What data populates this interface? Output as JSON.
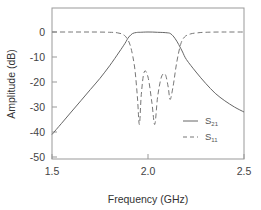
{
  "chart_data": {
    "type": "line",
    "title": "",
    "xlabel": "Frequency (GHz)",
    "ylabel": "Amplitude (dB)",
    "xlim": [
      1.5,
      2.5
    ],
    "ylim": [
      -50,
      10
    ],
    "xticks": [
      1.5,
      2.0,
      2.5
    ],
    "xtick_labels": [
      "1.5",
      "2.0",
      "2.5"
    ],
    "yticks": [
      0,
      -10,
      -20,
      -30,
      -40,
      -50
    ],
    "ytick_labels": [
      "0",
      "-10",
      "-20",
      "-30",
      "-40",
      "-50"
    ],
    "grid": false,
    "legend_position": "lower right inside",
    "series": [
      {
        "name": "S21",
        "label_main": "S",
        "label_sub": "21",
        "style": "solid",
        "color": "#666666",
        "x": [
          1.5,
          1.55,
          1.6,
          1.65,
          1.7,
          1.75,
          1.8,
          1.85,
          1.88,
          1.9,
          1.92,
          1.94,
          1.96,
          2.0,
          2.05,
          2.1,
          2.12,
          2.14,
          2.16,
          2.18,
          2.2,
          2.25,
          2.3,
          2.35,
          2.4,
          2.45,
          2.5
        ],
        "y": [
          -41,
          -36.5,
          -32,
          -27.5,
          -23,
          -18.5,
          -13.5,
          -8,
          -4.5,
          -2,
          -0.6,
          -0.2,
          -0.1,
          0,
          -0.1,
          -0.3,
          -0.8,
          -2.5,
          -5,
          -8,
          -11,
          -16,
          -20.5,
          -24.5,
          -27.5,
          -30,
          -32
        ]
      },
      {
        "name": "S11",
        "label_main": "S",
        "label_sub": "11",
        "style": "dashed",
        "color": "#777777",
        "x": [
          1.5,
          1.6,
          1.7,
          1.8,
          1.84,
          1.87,
          1.89,
          1.91,
          1.93,
          1.945,
          1.955,
          1.965,
          1.98,
          2.0,
          2.02,
          2.035,
          2.05,
          2.07,
          2.09,
          2.105,
          2.115,
          2.13,
          2.15,
          2.17,
          2.19,
          2.22,
          2.26,
          2.3,
          2.4,
          2.5
        ],
        "y": [
          0,
          0,
          0,
          -0.1,
          -0.3,
          -1,
          -2.5,
          -6,
          -14,
          -26,
          -37,
          -25,
          -16,
          -18,
          -28,
          -37,
          -26,
          -18,
          -17,
          -22,
          -27,
          -22,
          -12,
          -5,
          -2,
          -0.8,
          -0.3,
          -0.1,
          0,
          0
        ]
      }
    ]
  },
  "legend": {
    "items": [
      {
        "main": "S",
        "sub": "21"
      },
      {
        "main": "S",
        "sub": "11"
      }
    ]
  },
  "axes": {
    "x_label": "Frequency (GHz)",
    "y_label": "Amplitude (dB)"
  }
}
